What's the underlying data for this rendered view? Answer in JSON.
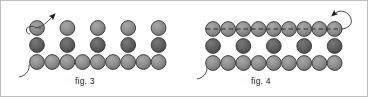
{
  "canvas": {
    "width": 368,
    "height": 97,
    "background": "#ffffff",
    "border_color": "#bdbdbd"
  },
  "palette": {
    "bead_light": "#8c8c8c",
    "bead_light_hi": "#a8a8a8",
    "bead_dark": "#5e5e5e",
    "bead_dark_hi": "#757575",
    "bead_outline": "#3a3a3a",
    "thread": "#4a4a4a",
    "arrow": "#1f1f1f",
    "caption_text": "#1a1a1a"
  },
  "figures": [
    {
      "id": "fig3",
      "caption": "fig. 3",
      "caption_x": 74,
      "caption_y": 75,
      "bead_radius": 7.4,
      "rows": [
        {
          "name": "top-row",
          "count": 5,
          "shade": "light",
          "spacing": 30.5,
          "x_start": 36,
          "y": 23,
          "contiguous": false
        },
        {
          "name": "middle-row",
          "count": 5,
          "shade": "dark",
          "spacing": 30.5,
          "x_start": 36,
          "y": 43,
          "contiguous": false
        },
        {
          "name": "bottom-row",
          "count": 9,
          "shade": "light",
          "spacing": 15.2,
          "x_start": 36,
          "y": 61,
          "contiguous": true
        }
      ],
      "thread": {
        "needle_bead": "top-left",
        "arrow_direction": "up-right",
        "arrow_tip_x": 58,
        "arrow_tip_y": 9,
        "tail_origin": "bottom-left"
      }
    },
    {
      "id": "fig4",
      "caption": "fig. 4",
      "caption_x": 250,
      "caption_y": 75,
      "bead_radius": 7.4,
      "rows": [
        {
          "name": "top-row",
          "count": 9,
          "shade": "light",
          "spacing": 15.2,
          "x_start": 212,
          "y": 27,
          "contiguous": true
        },
        {
          "name": "middle-row",
          "count": 5,
          "shade": "dark",
          "spacing": 30.5,
          "x_start": 212,
          "y": 45,
          "contiguous": false
        },
        {
          "name": "bottom-row",
          "count": 9,
          "shade": "light",
          "spacing": 15.2,
          "x_start": 212,
          "y": 62,
          "contiguous": true
        }
      ],
      "thread": {
        "needle_bead": "top-right",
        "arrow_direction": "up-left",
        "arrow_tip_x": 334,
        "arrow_tip_y": 10,
        "tail_origin": "bottom-left",
        "runs_through_top_row": true
      }
    }
  ]
}
